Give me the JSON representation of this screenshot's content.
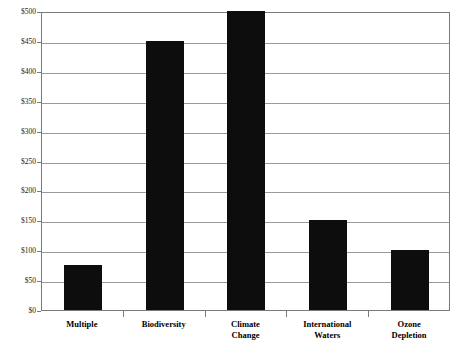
{
  "chart_data": {
    "type": "bar",
    "title": "",
    "subtitle": "",
    "xlabel": "",
    "ylabel": "",
    "categories": [
      "Multiple",
      "Biodiversity",
      "Climate Change",
      "International Waters",
      "Ozone Depletion"
    ],
    "category_lines": [
      [
        "Multiple"
      ],
      [
        "Biodiversity"
      ],
      [
        "Climate",
        "Change"
      ],
      [
        "International",
        "Waters"
      ],
      [
        "Ozone",
        "Depletion"
      ]
    ],
    "values": [
      75,
      450,
      500,
      150,
      100
    ],
    "ylim": [
      0,
      500
    ],
    "ytick_step": 50,
    "ytick_values": [
      0,
      50,
      100,
      150,
      200,
      250,
      300,
      350,
      400,
      450,
      500
    ],
    "ytick_labels": [
      "$0",
      "$50",
      "$100",
      "$150",
      "$200",
      "$250",
      "$300",
      "$350",
      "$400",
      "$450",
      "$500"
    ],
    "grid": true,
    "grid_axis": "y",
    "legend": false,
    "legend_position": "none",
    "bar_color": "#0d0d0d",
    "gridline_color": "#9a9a9a",
    "frame_color": "#7a7a7a",
    "background_color": "#ffffff",
    "text_color": "#000000"
  }
}
